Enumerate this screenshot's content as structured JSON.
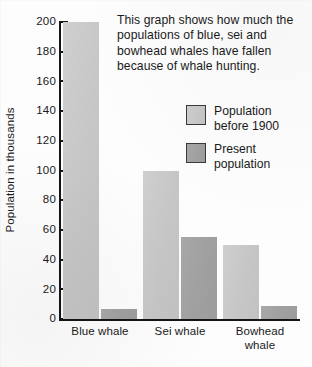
{
  "chart_data": {
    "type": "bar",
    "title": "",
    "xlabel": "",
    "ylabel": "Population in thousands",
    "ylim": [
      0,
      200
    ],
    "yticks": [
      200,
      180,
      160,
      140,
      120,
      100,
      80,
      60,
      40,
      20,
      0
    ],
    "grid": false,
    "legend_position": "inside-upper-right",
    "categories": [
      "Blue whale",
      "Sei whale",
      "Bowhead whale"
    ],
    "series": [
      {
        "name": "Population before 1900",
        "values": [
          200,
          100,
          50
        ],
        "color": "#c6c6c6"
      },
      {
        "name": "Present population",
        "values": [
          7,
          55,
          9
        ],
        "color": "#a0a0a0"
      }
    ],
    "annotations": [
      "This graph shows how much the populations of blue, sei and bowhead whales have fallen because of whale hunting."
    ]
  },
  "description": "This graph shows how much the populations of blue, sei and bowhead whales have fallen because of whale hunting.",
  "axis": {
    "y_title": "Population in thousands",
    "y_ticks": [
      "200",
      "180",
      "160",
      "140",
      "120",
      "100",
      "80",
      "60",
      "40",
      "20",
      "0"
    ]
  },
  "categories": [
    {
      "label": "Blue whale"
    },
    {
      "label": "Sei whale"
    },
    {
      "label": "Bowhead\nwhale"
    }
  ],
  "legend": {
    "items": [
      {
        "label": "Population\nbefore 1900",
        "color": "#c6c6c6"
      },
      {
        "label": "Present\npopulation",
        "color": "#a0a0a0"
      }
    ]
  }
}
